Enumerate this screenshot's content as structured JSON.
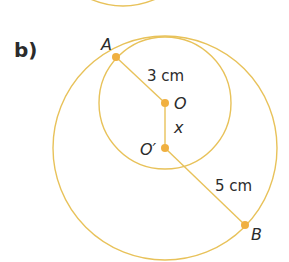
{
  "part_label": "b)",
  "colors": {
    "circle_stroke": "#E8C25A",
    "point_fill": "#F0B040",
    "text": "#2b2b2b"
  },
  "points": {
    "A": {
      "label": "A"
    },
    "O": {
      "label": "O"
    },
    "O_prime": {
      "label": "O′"
    },
    "B": {
      "label": "B"
    }
  },
  "segments": {
    "OA": {
      "label": "3 cm"
    },
    "OO_prime": {
      "label": "x"
    },
    "O_primeB": {
      "label": "5 cm"
    }
  },
  "circles": [
    {
      "name": "small-circle",
      "center": "O",
      "radius_label": "3 cm"
    },
    {
      "name": "large-circle",
      "center": "O′",
      "radius_label": "5 cm"
    }
  ]
}
